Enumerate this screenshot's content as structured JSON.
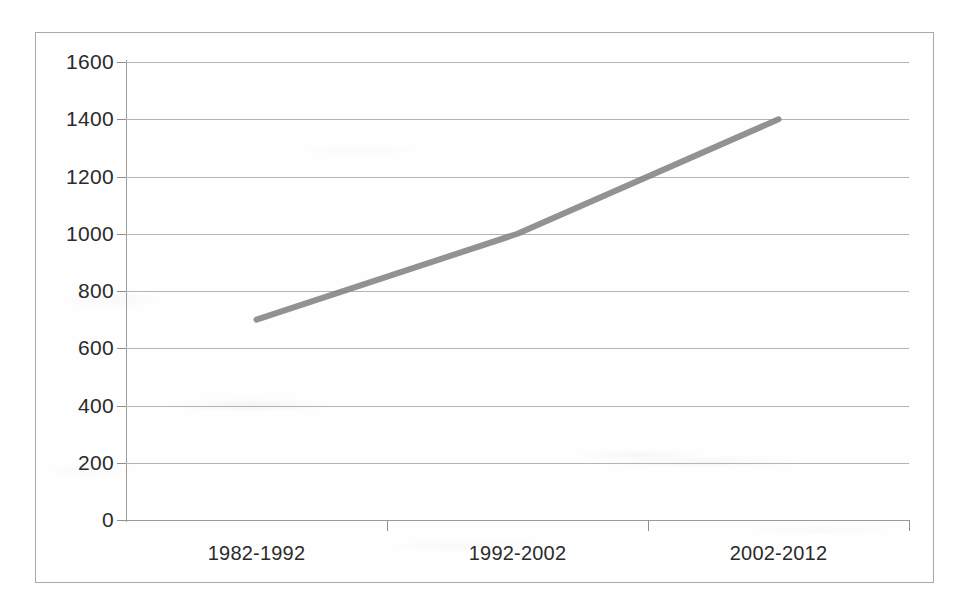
{
  "chart_data": {
    "type": "line",
    "title": "",
    "subtitle": "",
    "xlabel": "",
    "ylabel": "",
    "categories": [
      "1982-1992",
      "1992-2002",
      "2002-2012"
    ],
    "series": [
      {
        "name": "",
        "values": [
          700,
          1000,
          1400
        ],
        "color": "#808080"
      }
    ],
    "ylim": [
      0,
      1600
    ],
    "y_ticks": [
      0,
      200,
      400,
      600,
      800,
      1000,
      1200,
      1400,
      1600
    ],
    "y_tick_labels": [
      "0",
      "200",
      "400",
      "600",
      "800",
      "1000",
      "1200",
      "1400",
      "1600"
    ],
    "grid": true,
    "grid_axis": "y",
    "legend": false,
    "legend_position": "none",
    "markers": false,
    "annotations": []
  },
  "style": {
    "line_color": "#808080",
    "grid_color": "#b4b4b4",
    "axis_color": "#9c9c9c",
    "frame_color": "#a9a9a9",
    "text_color": "#2b2b2b",
    "background": "#fefefe"
  }
}
